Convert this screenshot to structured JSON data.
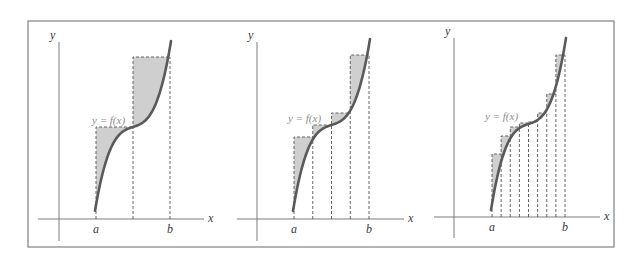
{
  "figure": {
    "frame": {
      "x": 28,
      "y": 21,
      "width": 586,
      "height": 226
    },
    "colors": {
      "fill": "#cfcfcf",
      "curve": "#5a5a5a",
      "axis": "#7c7c7c",
      "dash": "#555555",
      "label": "#3a3a3a",
      "function_label": "#8d8d8d"
    },
    "labels": {
      "x_axis": "x",
      "y_axis": "y",
      "left_endpoint": "a",
      "right_endpoint": "b",
      "function": "y = f(x)"
    }
  },
  "panels": [
    {
      "name": "panel-2-rectangles",
      "subintervals": 2,
      "origin": {
        "x": 59,
        "y": 219
      },
      "y_axis": {
        "top": 42,
        "bottom": 241
      },
      "x_axis": {
        "left": 38,
        "right": 204
      },
      "a": 96,
      "b": 170,
      "curve_y_top": 47,
      "curve_y_bottom": 205,
      "curve_mid_y": 127,
      "function_label_pos": {
        "x": 92,
        "y": 124
      },
      "heights": [
        127,
        57
      ]
    },
    {
      "name": "panel-4-rectangles",
      "subintervals": 4,
      "origin": {
        "x": 257,
        "y": 219
      },
      "y_axis": {
        "top": 42,
        "bottom": 241
      },
      "x_axis": {
        "left": 237,
        "right": 404
      },
      "a": 294,
      "b": 369,
      "curve_y_top": 45,
      "curve_y_bottom": 205,
      "curve_mid_y": 125,
      "function_label_pos": {
        "x": 288,
        "y": 122
      },
      "heights": [
        137,
        125,
        113,
        55
      ]
    },
    {
      "name": "panel-8-rectangles",
      "subintervals": 8,
      "origin": {
        "x": 454,
        "y": 217
      },
      "y_axis": {
        "top": 38,
        "bottom": 238
      },
      "x_axis": {
        "left": 434,
        "right": 600
      },
      "a": 492,
      "b": 565,
      "curve_y_top": 44,
      "curve_y_bottom": 204,
      "curve_mid_y": 124,
      "function_label_pos": {
        "x": 485,
        "y": 120
      },
      "heights": [
        154,
        136,
        127,
        123,
        122,
        113,
        94,
        55
      ]
    }
  ],
  "chart_data": {
    "type": "diagram",
    "panels": [
      {
        "subintervals": 2,
        "rectangle": "right-endpoint (upper) sum"
      },
      {
        "subintervals": 4,
        "rectangle": "right-endpoint (upper) sum"
      },
      {
        "subintervals": 8,
        "rectangle": "right-endpoint (upper) sum"
      }
    ],
    "xlabel": "x",
    "ylabel": "y",
    "x_ticks": [
      "a",
      "b"
    ],
    "curve_label": "y = f(x)"
  }
}
